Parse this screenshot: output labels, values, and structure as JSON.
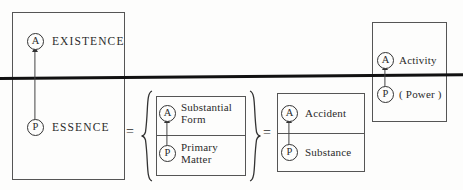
{
  "diagram": {
    "colors": {
      "ink": "#2b2b2b",
      "rule": "#555555",
      "thick_rule": "#111111",
      "background": "#fdfdfc"
    },
    "markers": {
      "act": "A",
      "potency": "P"
    },
    "operators": {
      "equals_1": "=",
      "equals_2": "="
    },
    "sections": [
      {
        "id": "existence-essence",
        "upper": {
          "marker": "A",
          "label": "EXISTENCE"
        },
        "lower": {
          "marker": "P",
          "label": "ESSENCE"
        }
      },
      {
        "id": "form-matter",
        "upper": {
          "marker": "A",
          "label": "Substantial Form",
          "line1": "Substantial",
          "line2": "Form"
        },
        "lower": {
          "marker": "P",
          "label": "Primary Matter",
          "line1": "Primary",
          "line2": "Matter"
        }
      },
      {
        "id": "accident-substance",
        "upper": {
          "marker": "A",
          "label": "Accident"
        },
        "lower": {
          "marker": "P",
          "label": "Substance"
        }
      },
      {
        "id": "activity-power",
        "upper": {
          "marker": "A",
          "label": "Activity"
        },
        "lower": {
          "marker": "P",
          "label": "( Power )"
        }
      }
    ]
  }
}
